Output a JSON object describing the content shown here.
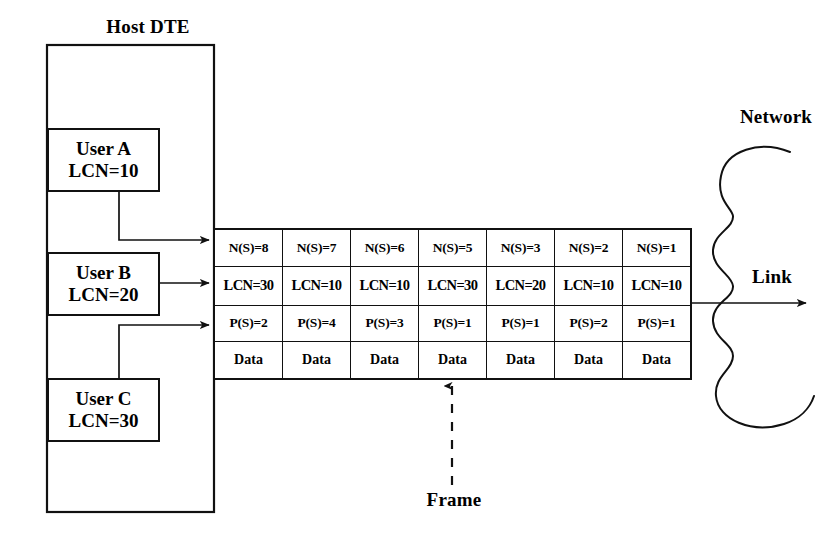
{
  "diagram": {
    "host_label": "Host DTE",
    "network_label": "Network",
    "link_label": "Link",
    "frame_label": "Frame",
    "ink_color": "#111111",
    "background_color": "#ffffff"
  },
  "users": [
    {
      "name": "User A",
      "lcn": "LCN=10"
    },
    {
      "name": "User B",
      "lcn": "LCN=20"
    },
    {
      "name": "User C",
      "lcn": "LCN=30"
    }
  ],
  "frame_table": {
    "row_labels": [
      "N(S)",
      "LCN",
      "P(S)",
      "Data"
    ],
    "columns": 7,
    "rows": {
      "ns": [
        "N(S)=8",
        "N(S)=7",
        "N(S)=6",
        "N(S)=5",
        "N(S)=3",
        "N(S)=2",
        "N(S)=1"
      ],
      "lcn": [
        "LCN=30",
        "LCN=10",
        "LCN=10",
        "LCN=30",
        "LCN=20",
        "LCN=10",
        "LCN=10"
      ],
      "ps": [
        "P(S)=2",
        "P(S)=4",
        "P(S)=3",
        "P(S)=1",
        "P(S)=1",
        "P(S)=2",
        "P(S)=1"
      ],
      "data": [
        "Data",
        "Data",
        "Data",
        "Data",
        "Data",
        "Data",
        "Data"
      ]
    }
  }
}
